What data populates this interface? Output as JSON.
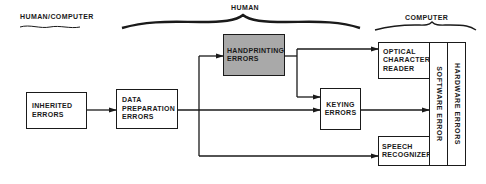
{
  "sections": {
    "human_computer": "HUMAN/COMPUTER",
    "human": "HUMAN",
    "computer": "COMPUTER"
  },
  "nodes": {
    "inherited": [
      "INHERITED",
      "ERRORS"
    ],
    "data_prep": [
      "DATA",
      "PREPARATION",
      "ERRORS"
    ],
    "handprinting": [
      "HANDPRINTING",
      "ERRORS"
    ],
    "keying": [
      "KEYING",
      "ERRORS"
    ],
    "ocr": [
      "OPTICAL",
      "CHARACTER",
      "READER"
    ],
    "speech": [
      "SPEECH",
      "RECOGNIZER"
    ],
    "software": "SOFTWARE ERROR",
    "hardware": "HARDWARE ERRORS"
  },
  "colors": {
    "line": "#1a1a1a",
    "highlight_box": "#a9a9a9"
  },
  "edges": [
    {
      "from": "inherited",
      "to": "data_prep"
    },
    {
      "from": "data_prep",
      "to": "handprinting"
    },
    {
      "from": "data_prep",
      "to": "keying"
    },
    {
      "from": "data_prep",
      "to": "speech"
    },
    {
      "from": "handprinting",
      "to": "ocr"
    },
    {
      "from": "handprinting",
      "to": "keying"
    },
    {
      "from": "keying",
      "to": "software"
    }
  ]
}
